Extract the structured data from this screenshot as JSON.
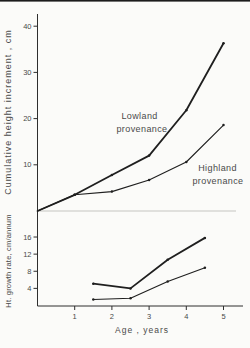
{
  "figure": {
    "background": "#fbfbf9",
    "ink": "#2e2e2e",
    "curve_color": "#1f1f1f",
    "separator_color": "#b9b9b4"
  },
  "top_panel": {
    "ylabel": "Cumulative height increment , cm",
    "series_labels": {
      "lowland": [
        "Lowland",
        "provenance"
      ],
      "highland": [
        "Highland",
        "provenance"
      ]
    }
  },
  "bottom_panel": {
    "ylabel": "Ht. growth rate, cm/annum"
  },
  "x_axis": {
    "label": "Age , years",
    "ticks": [
      1,
      2,
      3,
      4,
      5
    ]
  },
  "chart_data": [
    {
      "type": "line",
      "panel": "top",
      "title": "",
      "ylabel": "Cumulative height increment , cm",
      "xlabel": "Age , years",
      "x": [
        0,
        1,
        2,
        3,
        4,
        5
      ],
      "series": [
        {
          "name": "Lowland provenance",
          "values": [
            0,
            3.5,
            7.8,
            12.0,
            21.8,
            36.3
          ]
        },
        {
          "name": "Highland provenance",
          "values": [
            0,
            3.5,
            4.2,
            6.7,
            10.6,
            18.6
          ]
        }
      ],
      "yticks": [
        10,
        20,
        30,
        40
      ],
      "ylim": [
        0,
        43
      ],
      "xlim": [
        0,
        5.5
      ],
      "grid": false,
      "legend": "inline-annotations"
    },
    {
      "type": "line",
      "panel": "bottom",
      "title": "",
      "ylabel": "Ht. growth rate, cm/annum",
      "xlabel": "Age , years",
      "x": [
        1.5,
        2.5,
        3.5,
        4.5
      ],
      "series": [
        {
          "name": "Lowland provenance",
          "values": [
            5.1,
            4.0,
            10.7,
            15.8
          ]
        },
        {
          "name": "Highland provenance",
          "values": [
            1.4,
            1.7,
            5.6,
            8.8
          ]
        }
      ],
      "yticks": [
        4,
        8,
        12,
        16
      ],
      "ylim": [
        0,
        17
      ],
      "xlim": [
        0,
        5.5
      ],
      "grid": false
    }
  ]
}
